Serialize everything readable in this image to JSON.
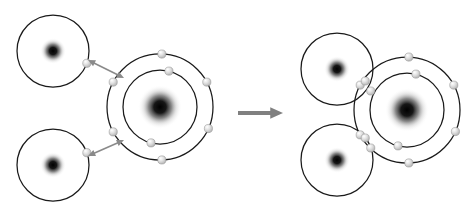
{
  "diagram": {
    "type": "chemical-bonding-diagram",
    "background_color": "#ffffff",
    "stroke_color": "#1a1a1a",
    "electron_color": "#d6d6d6",
    "electron_edge_color": "#8c8c8c",
    "nucleus_color": "#000000",
    "arrow_color": "#808080",
    "attraction_arrow_color": "#8a8a8a",
    "reactants_label": "",
    "products_label": "",
    "reaction_arrow_name": "reaction-arrow",
    "reaction_arrow_direction": "right"
  },
  "reactants": {
    "atoms": [
      {
        "name": "hydrogen-top-left",
        "element": "H",
        "label": "",
        "cx": 53,
        "cy": 51,
        "nucleus_r": 13,
        "shells": [
          {
            "r": 36,
            "electron_count": 1,
            "electron_angles_deg": [
              20
            ]
          }
        ]
      },
      {
        "name": "hydrogen-bottom-left",
        "element": "H",
        "label": "",
        "cx": 53,
        "cy": 165,
        "nucleus_r": 13,
        "shells": [
          {
            "r": 36,
            "electron_count": 1,
            "electron_angles_deg": [
              -20
            ]
          }
        ]
      },
      {
        "name": "oxygen-reactant",
        "element": "O",
        "label": "",
        "cx": 160,
        "cy": 107,
        "nucleus_r": 22,
        "shells": [
          {
            "r": 37,
            "electron_count": 2,
            "electron_angles_deg": [
              -76,
              104
            ]
          },
          {
            "r": 53,
            "electron_count": 6,
            "electron_angles_deg": [
              -88,
              -28,
              24,
              88,
              152,
              208
            ]
          }
        ]
      }
    ],
    "attraction_arrows": [
      {
        "name": "attraction-arrow-top",
        "style": "double-headed",
        "from_x": 88,
        "from_y": 60,
        "to_x": 124,
        "to_y": 78
      },
      {
        "name": "attraction-arrow-bottom",
        "style": "double-headed",
        "from_x": 88,
        "from_y": 156,
        "to_x": 124,
        "to_y": 140
      }
    ]
  },
  "products": {
    "atoms": [
      {
        "name": "hydrogen-top-right-bonded",
        "element": "H",
        "label": "",
        "cx": 337,
        "cy": 69,
        "nucleus_r": 13,
        "shells": [
          {
            "r": 36,
            "electron_count": 0,
            "electron_angles_deg": []
          }
        ]
      },
      {
        "name": "hydrogen-bottom-right-bonded",
        "element": "H",
        "label": "",
        "cx": 337,
        "cy": 160,
        "nucleus_r": 13,
        "shells": [
          {
            "r": 36,
            "electron_count": 0,
            "electron_angles_deg": []
          }
        ]
      },
      {
        "name": "oxygen-product",
        "element": "O",
        "label": "",
        "cx": 407,
        "cy": 110,
        "nucleus_r": 22,
        "shells": [
          {
            "r": 37,
            "electron_count": 2,
            "electron_angles_deg": [
              -76,
              104
            ]
          },
          {
            "r": 53,
            "electron_count": 6,
            "electron_angles_deg": [
              -88,
              -28,
              24,
              88,
              152,
              208
            ]
          }
        ]
      }
    ],
    "shared_pairs": [
      {
        "name": "shared-electron-pair-top",
        "electron_count": 2,
        "x": 368,
        "y": 86,
        "offset": 5
      },
      {
        "name": "shared-electron-pair-bottom",
        "electron_count": 2,
        "x": 368,
        "y": 143,
        "offset": 5
      }
    ]
  },
  "reaction_arrow": {
    "name": "reaction-arrow",
    "x1": 238,
    "y1": 113,
    "x2": 283,
    "y2": 113
  }
}
